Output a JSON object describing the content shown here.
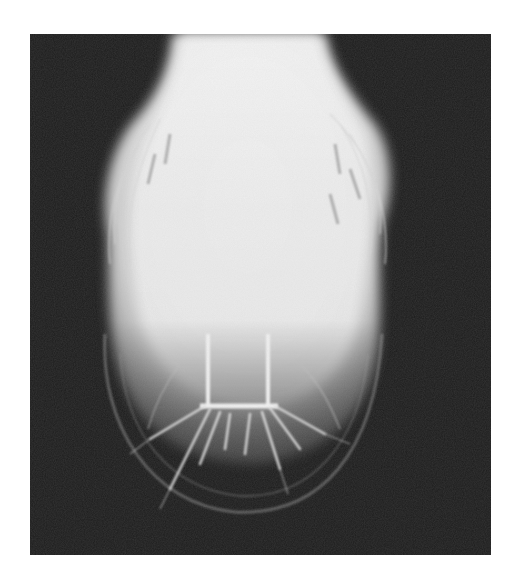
{
  "image": {
    "subject": "radiograph-hoof-vasculature",
    "background_color": "#1c1c1c",
    "page_color": "#ffffff",
    "highlight_color": "#f4f4f4",
    "vessel_color": "#e8e8e8"
  }
}
